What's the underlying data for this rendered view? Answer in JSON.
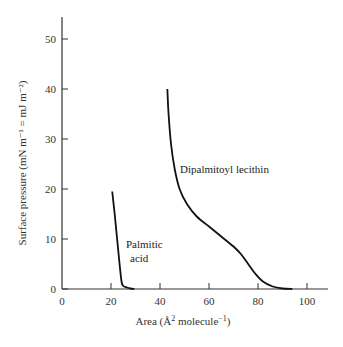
{
  "chart_data": {
    "type": "line",
    "title": "",
    "xlabel": "Area (Å² molecule⁻¹)",
    "ylabel": "Surface pressure (mN m⁻¹ = mJ m⁻²)",
    "xlim": [
      0,
      107
    ],
    "ylim": [
      0,
      55
    ],
    "xticks": [
      0,
      20,
      40,
      60,
      80,
      100
    ],
    "yticks": [
      0,
      10,
      20,
      30,
      40,
      50
    ],
    "grid": false,
    "legend": null,
    "series": [
      {
        "name": "Palmitic acid",
        "x": [
          20.5,
          21.5,
          22.5,
          23.5,
          24.3,
          25,
          26.5,
          28,
          29.5
        ],
        "y": [
          19.5,
          15,
          10,
          5,
          1.5,
          0.6,
          0.3,
          0.1,
          0
        ]
      },
      {
        "name": "Dipalmitoyl lecithin",
        "x": [
          43,
          43.5,
          44.5,
          46,
          48,
          51,
          55,
          60,
          65,
          70,
          73,
          76,
          79,
          82,
          86,
          90,
          94
        ],
        "y": [
          40,
          35,
          29,
          24,
          20,
          17,
          14.5,
          12.5,
          10.5,
          8.5,
          7,
          5,
          3,
          1.5,
          0.5,
          0.1,
          0
        ]
      }
    ],
    "annotations": [
      {
        "text": "Dipalmitoyl lecithin",
        "x": 55,
        "y": 23
      },
      {
        "text": "Palmitic",
        "x": 31,
        "y": 12.5
      },
      {
        "text": "acid",
        "x": 33,
        "y": 9
      }
    ]
  },
  "labels": {
    "x_axis": "Area (Å",
    "x_axis_sup": "2",
    "x_axis_mid": " molecule",
    "x_axis_sup2": "−1",
    "x_axis_end": ")",
    "y_axis": "Surface pressure (mN m⁻¹ = mJ m⁻²)",
    "annot_dppc": "Dipalmitoyl lecithin",
    "annot_pa_1": "Palmitic",
    "annot_pa_2": "acid"
  }
}
